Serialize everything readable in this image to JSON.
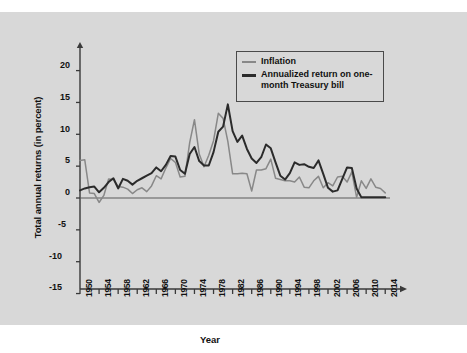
{
  "figure": {
    "background_color": "#d8d8d8",
    "page_background": "#ffffff"
  },
  "axis": {
    "y_title": "Total annual returns (in percent)",
    "x_title": "Year",
    "y_ticks": [
      "20",
      "15",
      "10",
      "5",
      "0",
      "-5",
      "-10",
      "-15"
    ],
    "x_ticks": [
      "1950",
      "1954",
      "1958",
      "1962",
      "1966",
      "1970",
      "1974",
      "1978",
      "1982",
      "1986",
      "1990",
      "1994",
      "1998",
      "2002",
      "2006",
      "2010",
      "2014"
    ]
  },
  "legend": {
    "items": [
      {
        "label": "Inflation",
        "color": "#888888",
        "key": "inflation"
      },
      {
        "label": "Annualized return on one-month Treasury bill",
        "color": "#2b2b2b",
        "key": "tbill"
      }
    ]
  },
  "caption": {
    "partial_text": ""
  },
  "chart_data": {
    "type": "line",
    "title": "",
    "xlabel": "Year",
    "ylabel": "Total annual returns (in percent)",
    "xlim": [
      1950,
      2015
    ],
    "ylim": [
      -15,
      22
    ],
    "ytick_step": 5,
    "xtick_step": 4,
    "grid": false,
    "legend_position": "top-right",
    "zero_line": true,
    "x": [
      1950,
      1951,
      1952,
      1953,
      1954,
      1955,
      1956,
      1957,
      1958,
      1959,
      1960,
      1961,
      1962,
      1963,
      1964,
      1965,
      1966,
      1967,
      1968,
      1969,
      1970,
      1971,
      1972,
      1973,
      1974,
      1975,
      1976,
      1977,
      1978,
      1979,
      1980,
      1981,
      1982,
      1983,
      1984,
      1985,
      1986,
      1987,
      1988,
      1989,
      1990,
      1991,
      1992,
      1993,
      1994,
      1995,
      1996,
      1997,
      1998,
      1999,
      2000,
      2001,
      2002,
      2003,
      2004,
      2005,
      2006,
      2007,
      2008,
      2009,
      2010,
      2011,
      2012,
      2013,
      2014
    ],
    "series": [
      {
        "name": "Inflation",
        "color": "#888888",
        "values": [
          5.9,
          6.0,
          0.8,
          0.7,
          -0.7,
          0.4,
          3.0,
          2.9,
          1.8,
          1.7,
          1.4,
          0.7,
          1.3,
          1.6,
          1.0,
          1.9,
          3.5,
          3.0,
          4.7,
          6.2,
          5.6,
          3.3,
          3.4,
          8.7,
          12.3,
          6.9,
          4.9,
          6.7,
          9.0,
          13.3,
          12.5,
          8.9,
          3.8,
          3.8,
          3.9,
          3.8,
          1.1,
          4.4,
          4.4,
          4.6,
          6.1,
          3.1,
          2.9,
          2.7,
          2.7,
          2.5,
          3.3,
          1.7,
          1.6,
          2.7,
          3.4,
          1.6,
          2.4,
          1.9,
          3.3,
          3.4,
          2.5,
          4.1,
          0.1,
          2.7,
          1.5,
          3.0,
          1.7,
          1.5,
          0.8
        ],
        "linewidth": 1.5
      },
      {
        "name": "Annualized return on one-month Treasury bill",
        "color": "#2b2b2b",
        "values": [
          1.2,
          1.5,
          1.7,
          1.8,
          0.9,
          1.6,
          2.5,
          3.1,
          1.5,
          3.0,
          2.7,
          2.1,
          2.7,
          3.1,
          3.5,
          3.9,
          4.8,
          4.2,
          5.2,
          6.6,
          6.5,
          4.4,
          3.8,
          6.9,
          8.0,
          5.8,
          5.1,
          5.1,
          7.2,
          10.4,
          11.2,
          14.7,
          10.5,
          8.8,
          9.8,
          7.7,
          6.2,
          5.5,
          6.4,
          8.4,
          7.8,
          5.6,
          3.5,
          2.9,
          3.9,
          5.6,
          5.2,
          5.3,
          4.9,
          4.7,
          5.9,
          3.8,
          1.6,
          1.0,
          1.2,
          3.0,
          4.8,
          4.7,
          1.5,
          0.1,
          0.1,
          0.1,
          0.1,
          0.1,
          0.1
        ],
        "linewidth": 2.0
      }
    ]
  },
  "plot_geometry": {
    "left_px": 80,
    "right_px": 390,
    "zero_y_px": 186,
    "px_per_unit": 6.37,
    "top_arrow_y_px": 30,
    "baseline_y_px": 277
  }
}
